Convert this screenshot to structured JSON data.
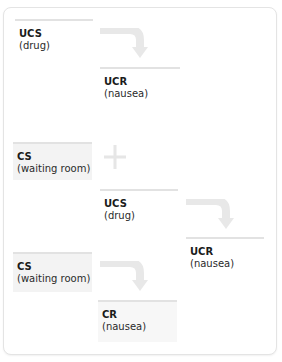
{
  "diagram": {
    "colors": {
      "frame_border": "#e4e4e4",
      "box_rule": "#e2e2e2",
      "shaded_box": "#f3f3f3",
      "arrow": "#e6e6e6",
      "text": "#1b1b1b"
    },
    "stages": [
      {
        "name": "before-conditioning",
        "stimulus": {
          "term": "UCS",
          "desc": "(drug)"
        },
        "response": {
          "term": "UCR",
          "desc": "(nausea)"
        }
      },
      {
        "name": "during-conditioning",
        "neutral": {
          "term": "CS",
          "desc": "(waiting room)"
        },
        "operator": "+",
        "stimulus": {
          "term": "UCS",
          "desc": "(drug)"
        },
        "response": {
          "term": "UCR",
          "desc": "(nausea)"
        }
      },
      {
        "name": "after-conditioning",
        "stimulus": {
          "term": "CS",
          "desc": "(waiting room)"
        },
        "response": {
          "term": "CR",
          "desc": "(nausea)"
        }
      }
    ]
  }
}
